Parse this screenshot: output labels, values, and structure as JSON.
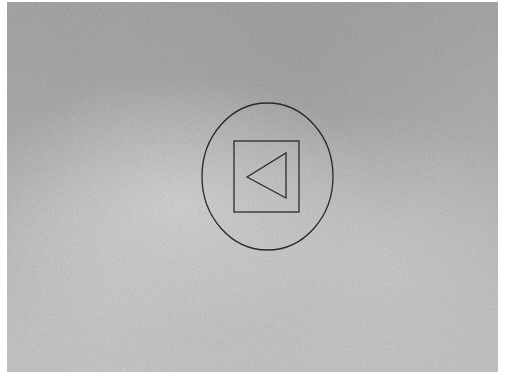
{
  "scene": {
    "description": "textured gray paper with a hand-drawn back/play-reverse symbol",
    "background_color": "#b5b5b5",
    "margin_color": "#ffffff",
    "stroke_color": "#2a2a2a"
  },
  "symbol": {
    "icon": "back-triangle-in-square-in-circle",
    "circle": {
      "cx": 267.5,
      "cy": 176.5,
      "rx": 65.5,
      "ry": 73.5
    },
    "square": {
      "x": 234,
      "y": 141,
      "width": 65,
      "height": 71
    },
    "triangle": {
      "points": "247,177 286,153 286,198"
    }
  }
}
